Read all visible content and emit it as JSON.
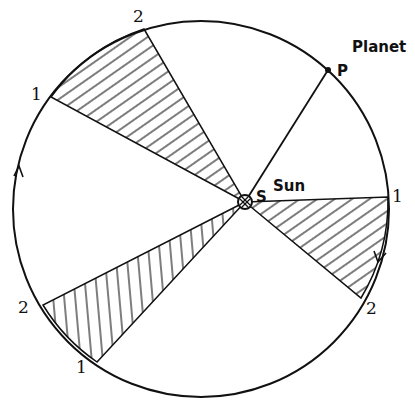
{
  "diagram": {
    "labels": {
      "planet": "Planet",
      "planet_point": "P",
      "sun": "Sun",
      "sun_point": "S",
      "top_left_1": "1",
      "top_left_2": "2",
      "right_1": "1",
      "right_2": "2",
      "bottom_left_2": "2",
      "bottom_left_1": "1"
    },
    "orbit": {
      "cx": 201,
      "cy": 209,
      "r": 188
    },
    "sun_position": {
      "x": 245,
      "y": 202
    },
    "planet_position": {
      "x": 328,
      "y": 70
    },
    "sectors": [
      {
        "name": "upper-left-sector",
        "p1": [
          51,
          97
        ],
        "p2": [
          144,
          29
        ],
        "hatch": "diagonal"
      },
      {
        "name": "right-sector",
        "p1": [
          388,
          197
        ],
        "p2": [
          361,
          298
        ],
        "hatch": "diagonal"
      },
      {
        "name": "lower-left-sector",
        "p1": [
          43,
          305
        ],
        "p2": [
          97,
          362
        ],
        "hatch": "vertical"
      }
    ],
    "arrows": [
      {
        "name": "left-direction-arrow",
        "direction": "up"
      },
      {
        "name": "right-direction-arrow",
        "direction": "down"
      }
    ],
    "colors": {
      "ink": "#111111",
      "background": "#ffffff"
    }
  }
}
